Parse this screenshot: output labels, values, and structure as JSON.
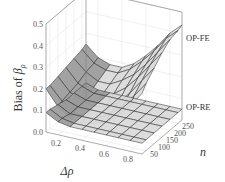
{
  "chart_data": {
    "type": "surface3d",
    "title": "",
    "xlabel": "Δρ",
    "ylabel": "n",
    "zlabel": "Bias of β̂ρ",
    "zlabel_text": "Bias of ",
    "zlabel_symbol": "β",
    "zlabel_sub": "ρ",
    "x_ticks": [
      "0.2",
      "0.4",
      "0.6",
      "0.8"
    ],
    "y_ticks": [
      "50",
      "100",
      "150",
      "200",
      "250"
    ],
    "z_ticks": [
      "0.0",
      "0.1",
      "0.2",
      "0.3",
      "0.4",
      "0.5"
    ],
    "xlim": [
      0.1,
      0.9
    ],
    "ylim": [
      25,
      275
    ],
    "zlim": [
      0,
      0.5
    ],
    "grid": true,
    "x": [
      0.1,
      0.2,
      0.3,
      0.4,
      0.5,
      0.6,
      0.7,
      0.8,
      0.9
    ],
    "n": [
      25,
      50,
      100,
      150,
      200,
      250,
      275
    ],
    "series": [
      {
        "name": "OP-FE",
        "values_by_n": [
          [
            0.2,
            0.13,
            0.09,
            0.08,
            0.09,
            0.11,
            0.15,
            0.21,
            0.28
          ],
          [
            0.2,
            0.14,
            0.1,
            0.09,
            0.1,
            0.13,
            0.18,
            0.24,
            0.31
          ],
          [
            0.21,
            0.15,
            0.12,
            0.11,
            0.12,
            0.15,
            0.21,
            0.28,
            0.35
          ],
          [
            0.22,
            0.16,
            0.13,
            0.13,
            0.15,
            0.19,
            0.25,
            0.32,
            0.39
          ],
          [
            0.23,
            0.18,
            0.15,
            0.15,
            0.18,
            0.22,
            0.28,
            0.35,
            0.42
          ],
          [
            0.24,
            0.19,
            0.17,
            0.17,
            0.2,
            0.25,
            0.31,
            0.38,
            0.43
          ],
          [
            0.25,
            0.2,
            0.18,
            0.18,
            0.21,
            0.26,
            0.32,
            0.39,
            0.44
          ]
        ]
      },
      {
        "name": "OP-RE",
        "values_by_n": [
          [
            0.09,
            0.06,
            0.05,
            0.05,
            0.05,
            0.05,
            0.05,
            0.05,
            0.05
          ],
          [
            0.09,
            0.06,
            0.05,
            0.05,
            0.05,
            0.05,
            0.05,
            0.05,
            0.05
          ],
          [
            0.08,
            0.05,
            0.05,
            0.05,
            0.05,
            0.05,
            0.05,
            0.05,
            0.05
          ],
          [
            0.07,
            0.05,
            0.05,
            0.05,
            0.05,
            0.05,
            0.05,
            0.05,
            0.05
          ],
          [
            0.07,
            0.05,
            0.05,
            0.05,
            0.05,
            0.05,
            0.05,
            0.05,
            0.05
          ],
          [
            0.07,
            0.05,
            0.05,
            0.05,
            0.05,
            0.05,
            0.05,
            0.05,
            0.05
          ],
          [
            0.07,
            0.05,
            0.05,
            0.05,
            0.05,
            0.05,
            0.05,
            0.05,
            0.05
          ]
        ]
      }
    ],
    "annotations": [
      "OP-FE",
      "OP-RE"
    ],
    "colors": {
      "surface_light": "#d9d9d9",
      "surface_dark": "#9a9a9a",
      "mesh": "#333333",
      "grid": "#e6e6e6",
      "axis": "#888888"
    }
  }
}
